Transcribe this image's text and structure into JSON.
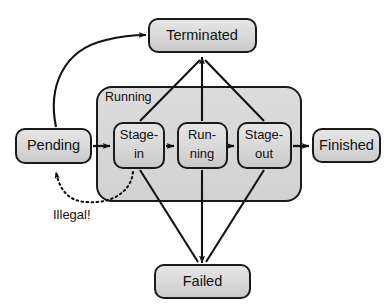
{
  "diagram": {
    "colors": {
      "state_fill_top": "#e2e2e2",
      "state_fill_bottom": "#cfcfcf",
      "state_stroke": "#1a1a1a",
      "group_fill": "#d9d9d9",
      "group_stroke": "#1a1a1a",
      "edge_stroke": "#111111",
      "text": "#111111",
      "background": "#ffffff"
    },
    "states": [
      {
        "id": "pending",
        "label": "Pending",
        "x": 16,
        "y": 129,
        "w": 75,
        "h": 34,
        "font": "lg"
      },
      {
        "id": "terminated",
        "label": "Terminated",
        "x": 149,
        "y": 19,
        "w": 107,
        "h": 33,
        "font": "lg"
      },
      {
        "id": "finished",
        "label": "Finished",
        "x": 313,
        "y": 129,
        "w": 67,
        "h": 33,
        "font": "lg"
      },
      {
        "id": "failed",
        "label": "Failed",
        "x": 155,
        "y": 265,
        "w": 95,
        "h": 33,
        "font": "lg"
      }
    ],
    "group": {
      "id": "running-group",
      "label": "Running",
      "x": 97,
      "y": 87,
      "w": 204,
      "h": 114,
      "label_x": 105,
      "label_y": 98
    },
    "substates": [
      {
        "id": "stage-in",
        "line1": "Stage-",
        "line2": "in",
        "x": 114,
        "y": 123,
        "w": 50,
        "h": 45
      },
      {
        "id": "running",
        "line1": "Run-",
        "line2": "ning",
        "x": 178,
        "y": 123,
        "w": 49,
        "h": 45
      },
      {
        "id": "stage-out",
        "line1": "Stage-",
        "line2": "out",
        "x": 238,
        "y": 123,
        "w": 53,
        "h": 45
      }
    ],
    "annotations": [
      {
        "id": "illegal-note",
        "label": "Illegal!",
        "x": 53,
        "y": 216
      }
    ],
    "transitions": [
      {
        "id": "pending-to-stagein",
        "from": "pending",
        "to": "stage-in",
        "style": "solid"
      },
      {
        "id": "stagein-to-running",
        "from": "stage-in",
        "to": "running",
        "style": "solid"
      },
      {
        "id": "running-to-stageout",
        "from": "running",
        "to": "stage-out",
        "style": "solid"
      },
      {
        "id": "stageout-to-finished",
        "from": "stage-out",
        "to": "finished",
        "style": "solid"
      },
      {
        "id": "pending-to-terminated",
        "from": "pending",
        "to": "terminated",
        "style": "curved"
      },
      {
        "id": "stagein-to-terminated",
        "from": "stage-in",
        "to": "terminated",
        "style": "solid"
      },
      {
        "id": "running-to-terminated",
        "from": "running",
        "to": "terminated",
        "style": "solid"
      },
      {
        "id": "stageout-to-terminated",
        "from": "stage-out",
        "to": "terminated",
        "style": "solid"
      },
      {
        "id": "stagein-to-failed",
        "from": "stage-in",
        "to": "failed",
        "style": "solid"
      },
      {
        "id": "running-to-failed",
        "from": "running",
        "to": "failed",
        "style": "solid"
      },
      {
        "id": "stageout-to-failed",
        "from": "stage-out",
        "to": "failed",
        "style": "solid"
      },
      {
        "id": "stagein-to-pending",
        "from": "stage-in",
        "to": "pending",
        "style": "dotted",
        "note": "Illegal!"
      }
    ]
  }
}
